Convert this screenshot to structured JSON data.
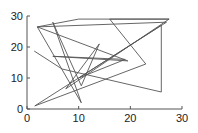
{
  "chart_data": {
    "type": "line",
    "title": "",
    "xlabel": "",
    "ylabel": "",
    "xlim": [
      0,
      30
    ],
    "ylim": [
      0,
      30
    ],
    "grid": false,
    "legend": null,
    "x_ticks": [
      0,
      10,
      20,
      30
    ],
    "y_ticks": [
      0,
      10,
      20,
      30
    ],
    "series": [
      {
        "name": "path",
        "color": "#555555",
        "points": [
          [
            1.4,
            18.7
          ],
          [
            6.8,
            12.9
          ],
          [
            26.0,
            5.5
          ],
          [
            26.0,
            27.0
          ],
          [
            1.5,
            1.0
          ],
          [
            23.0,
            14.5
          ],
          [
            16.0,
            29.0
          ],
          [
            27.5,
            29.0
          ],
          [
            7.5,
            6.5
          ],
          [
            14.0,
            21.0
          ],
          [
            10.5,
            7.5
          ],
          [
            5.0,
            28.0
          ],
          [
            10.5,
            2.0
          ],
          [
            2.0,
            26.5
          ],
          [
            19.5,
            15.5
          ],
          [
            5.0,
            17.0
          ],
          [
            19.0,
            16.0
          ],
          [
            10.0,
            10.0
          ],
          [
            27.0,
            28.0
          ],
          [
            2.0,
            26.5
          ],
          [
            10.0,
            29.0
          ],
          [
            27.5,
            29.0
          ]
        ]
      }
    ]
  },
  "axes": {
    "x_tick_labels": [
      "0",
      "10",
      "20",
      "30"
    ],
    "y_tick_labels": [
      "0",
      "10",
      "20",
      "30"
    ]
  }
}
